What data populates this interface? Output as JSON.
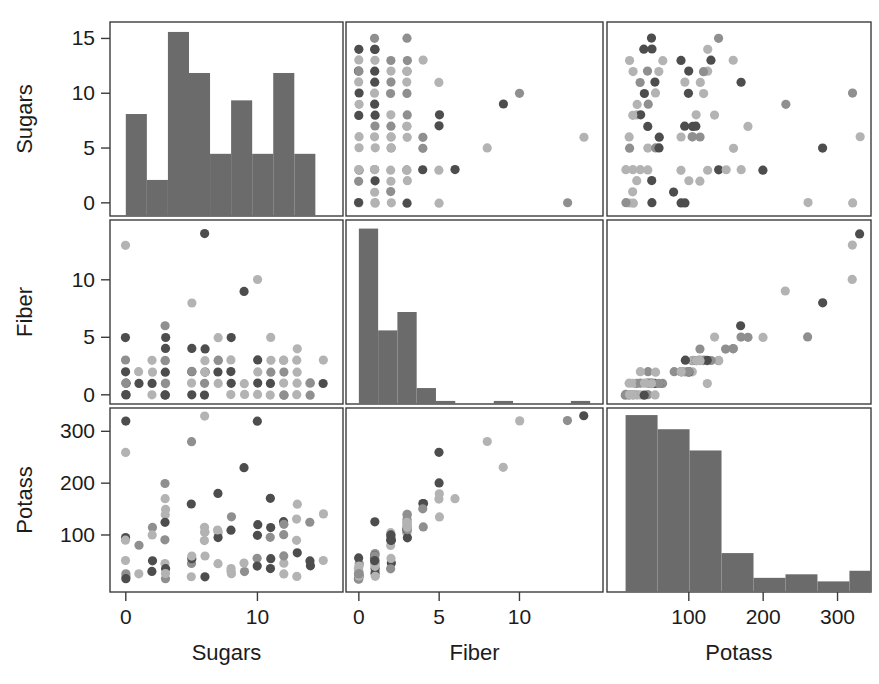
{
  "figure": {
    "title": "",
    "type": "scatterplot-matrix",
    "variables": [
      "Sugars",
      "Fiber",
      "Potass"
    ],
    "marker_colors": {
      "dark": "#4d4d4d",
      "light": "#b3b3b3",
      "mid": "#8f8f8f"
    },
    "histogram_color": "#6b6b6b",
    "frame_color": "#3c3c3c",
    "background": "#ffffff"
  },
  "axes": {
    "sugars": {
      "label": "Sugars",
      "range": [
        -1.2,
        16.5
      ],
      "x_ticks": [
        0,
        10
      ],
      "x_tick_labels": [
        "0",
        "10"
      ],
      "y_ticks": [
        0,
        5,
        10,
        15
      ],
      "y_tick_labels": [
        "0",
        "5",
        "10",
        "15"
      ]
    },
    "fiber": {
      "label": "Fiber",
      "range": [
        -0.8,
        15.2
      ],
      "x_ticks": [
        0,
        5,
        10
      ],
      "x_tick_labels": [
        "0",
        "5",
        "10"
      ],
      "y_ticks": [
        0,
        5,
        10
      ],
      "y_tick_labels": [
        "0",
        "5",
        "10"
      ]
    },
    "potass": {
      "label": "Potass",
      "range": [
        -10,
        345
      ],
      "x_ticks": [
        100,
        200,
        300
      ],
      "x_tick_labels": [
        "100",
        "200",
        "300"
      ],
      "y_ticks": [
        100,
        200,
        300
      ],
      "y_tick_labels": [
        "100",
        "200",
        "300"
      ]
    }
  },
  "chart_data": {
    "type": "scatter",
    "title": "",
    "xlabel": "",
    "ylabel": "",
    "variables": [
      "Sugars",
      "Fiber",
      "Potass"
    ],
    "matrix_layout": [
      [
        "hist-sugars",
        "scatter-sugars-vs-fiber",
        "scatter-sugars-vs-potass"
      ],
      [
        "scatter-fiber-vs-sugars",
        "hist-fiber",
        "scatter-fiber-vs-potass"
      ],
      [
        "scatter-potass-vs-sugars",
        "scatter-potass-vs-fiber",
        "hist-potass"
      ]
    ],
    "grid": false,
    "legend": "none",
    "points": [
      {
        "sugars": 6,
        "fiber": 3.0,
        "potass": 105
      },
      {
        "sugars": 8,
        "fiber": 5.0,
        "potass": 135
      },
      {
        "sugars": 5,
        "fiber": 2.0,
        "potass": 45
      },
      {
        "sugars": 0,
        "fiber": 0.0,
        "potass": 25
      },
      {
        "sugars": 8,
        "fiber": 1.0,
        "potass": 30
      },
      {
        "sugars": 10,
        "fiber": 2.0,
        "potass": 100
      },
      {
        "sugars": 14,
        "fiber": 1.0,
        "potass": 125
      },
      {
        "sugars": 8,
        "fiber": 2.0,
        "potass": 35
      },
      {
        "sugars": 6,
        "fiber": 4.0,
        "potass": 115
      },
      {
        "sugars": 5,
        "fiber": 2.0,
        "potass": 55
      },
      {
        "sugars": 12,
        "fiber": 0.0,
        "potass": 45
      },
      {
        "sugars": 1,
        "fiber": 1.0,
        "potass": 25
      },
      {
        "sugars": 9,
        "fiber": 0.0,
        "potass": 30
      },
      {
        "sugars": 7,
        "fiber": 1.0,
        "potass": 45
      },
      {
        "sugars": 13,
        "fiber": 2.0,
        "potass": 90
      },
      {
        "sugars": 3,
        "fiber": 0.0,
        "potass": 15
      },
      {
        "sugars": 2,
        "fiber": 0.0,
        "potass": 30
      },
      {
        "sugars": 12,
        "fiber": 0.0,
        "potass": 25
      },
      {
        "sugars": 13,
        "fiber": 1.0,
        "potass": 65
      },
      {
        "sugars": 7,
        "fiber": 3.0,
        "potass": 105
      },
      {
        "sugars": 0,
        "fiber": 3.0,
        "potass": 95
      },
      {
        "sugars": 3,
        "fiber": 1.0,
        "potass": 45
      },
      {
        "sugars": 10,
        "fiber": 0.0,
        "potass": 55
      },
      {
        "sugars": 5,
        "fiber": 4.0,
        "potass": 160
      },
      {
        "sugars": 13,
        "fiber": 4.0,
        "potass": 160
      },
      {
        "sugars": 11,
        "fiber": 5.0,
        "potass": 170
      },
      {
        "sugars": 7,
        "fiber": 5.0,
        "potass": 180
      },
      {
        "sugars": 12,
        "fiber": 3.0,
        "potass": 125
      },
      {
        "sugars": 12,
        "fiber": 3.0,
        "potass": 120
      },
      {
        "sugars": 15,
        "fiber": 3.0,
        "potass": 140
      },
      {
        "sugars": 9,
        "fiber": 9.0,
        "potass": 230
      },
      {
        "sugars": 10,
        "fiber": 10.0,
        "potass": 320
      },
      {
        "sugars": 6,
        "fiber": 14.0,
        "potass": 330
      },
      {
        "sugars": 3,
        "fiber": 1.0,
        "potass": 35
      },
      {
        "sugars": 5,
        "fiber": 0.0,
        "potass": 20
      },
      {
        "sugars": 0,
        "fiber": 1.0,
        "potass": 20
      },
      {
        "sugars": 2,
        "fiber": 3.0,
        "potass": 115
      },
      {
        "sugars": 3,
        "fiber": 2.0,
        "potass": 90
      },
      {
        "sugars": 11,
        "fiber": 0.0,
        "potass": 35
      },
      {
        "sugars": 14,
        "fiber": 0.0,
        "potass": 40
      },
      {
        "sugars": 3,
        "fiber": 6.0,
        "potass": 170
      },
      {
        "sugars": 0,
        "fiber": 1.0,
        "potass": 50
      },
      {
        "sugars": 7,
        "fiber": 2.0,
        "potass": 95
      },
      {
        "sugars": 12,
        "fiber": 1.0,
        "potass": 60
      },
      {
        "sugars": 6,
        "fiber": 2.0,
        "potass": 105
      },
      {
        "sugars": 10,
        "fiber": 3.0,
        "potass": 120
      },
      {
        "sugars": 3,
        "fiber": 3.0,
        "potass": 140
      },
      {
        "sugars": 11,
        "fiber": 1.0,
        "potass": 55
      },
      {
        "sugars": 13,
        "fiber": 3.0,
        "potass": 130
      },
      {
        "sugars": 0,
        "fiber": 0.0,
        "potass": 15
      },
      {
        "sugars": 6,
        "fiber": 0.0,
        "potass": 20
      },
      {
        "sugars": 9,
        "fiber": 1.0,
        "potass": 45
      },
      {
        "sugars": 3,
        "fiber": 3.0,
        "potass": 125
      },
      {
        "sugars": 3,
        "fiber": 4.0,
        "potass": 150
      },
      {
        "sugars": 0,
        "fiber": 5.0,
        "potass": 260
      },
      {
        "sugars": 5,
        "fiber": 8.0,
        "potass": 280
      },
      {
        "sugars": 1,
        "fiber": 2.0,
        "potass": 80
      },
      {
        "sugars": 14,
        "fiber": 1.0,
        "potass": 50
      },
      {
        "sugars": 15,
        "fiber": 1.0,
        "potass": 50
      },
      {
        "sugars": 10,
        "fiber": 1.0,
        "potass": 40
      },
      {
        "sugars": 3,
        "fiber": 0.0,
        "potass": 25
      },
      {
        "sugars": 8,
        "fiber": 3.0,
        "potass": 110
      },
      {
        "sugars": 7,
        "fiber": 3.0,
        "potass": 110
      },
      {
        "sugars": 11,
        "fiber": 2.0,
        "potass": 95
      },
      {
        "sugars": 2,
        "fiber": 2.0,
        "potass": 100
      },
      {
        "sugars": 12,
        "fiber": 2.0,
        "potass": 100
      },
      {
        "sugars": 13,
        "fiber": 0.0,
        "potass": 20
      },
      {
        "sugars": 0,
        "fiber": 13.0,
        "potass": 320
      },
      {
        "sugars": 5,
        "fiber": 1.0,
        "potass": 60
      },
      {
        "sugars": 6,
        "fiber": 1.0,
        "potass": 60
      },
      {
        "sugars": 11,
        "fiber": 3.0,
        "potass": 115
      },
      {
        "sugars": 3,
        "fiber": 5.0,
        "potass": 200
      },
      {
        "sugars": 6,
        "fiber": 2.0,
        "potass": 90
      },
      {
        "sugars": 2,
        "fiber": 1.0,
        "potass": 50
      },
      {
        "sugars": 0,
        "fiber": 2.0,
        "potass": 90
      },
      {
        "sugars": 8,
        "fiber": 0.0,
        "potass": 25
      }
    ],
    "histograms": {
      "sugars": {
        "xlabel": "Sugars",
        "ylabel": "",
        "bin_edges": [
          0,
          1.6,
          3.2,
          4.8,
          6.4,
          8.0,
          9.6,
          11.2,
          12.8,
          14.4
        ],
        "counts": [
          8.2,
          2.9,
          14.8,
          11.5,
          5.0,
          9.3,
          5.0,
          11.5,
          5.0
        ],
        "ymax": 15.6
      },
      "fiber": {
        "xlabel": "Fiber",
        "ylabel": "",
        "bin_edges": [
          0,
          1.2,
          2.4,
          3.6,
          4.8,
          6.0,
          7.2,
          8.4,
          9.6,
          10.8,
          12.0,
          13.2,
          14.4
        ],
        "counts": [
          14.3,
          6.0,
          7.5,
          1.3,
          0.25,
          0,
          0,
          0.25,
          0,
          0,
          0,
          0.25
        ],
        "ymax": 15.0
      },
      "potass": {
        "xlabel": "Potass",
        "ylabel": "",
        "bin_edges": [
          15,
          58,
          101,
          144,
          187,
          230,
          273,
          316,
          345
        ],
        "counts": [
          25.0,
          23.0,
          20.0,
          5.5,
          2.0,
          2.5,
          1.5,
          3.0
        ],
        "ymax": 26.0
      }
    }
  },
  "column_labels": [
    "Sugars",
    "Fiber",
    "Potass"
  ],
  "row_labels": [
    "Sugars",
    "Fiber",
    "Potass"
  ]
}
